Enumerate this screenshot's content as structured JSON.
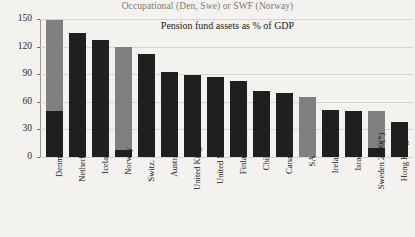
{
  "chart_data": {
    "type": "bar",
    "title": "Pension fund assets as % of GDP",
    "subtitle": "Occupational (Den, Swe) or SWF (Norway)",
    "xlabel": "",
    "ylabel": "",
    "ylim": [
      0,
      150
    ],
    "yticks": [
      0,
      30,
      60,
      90,
      120,
      150
    ],
    "ytick_labels": [
      "0",
      "30",
      "60",
      "90",
      "120",
      "150"
    ],
    "grid": true,
    "legend": "none",
    "stacked": true,
    "colors": {
      "dark": "#1f1f1f",
      "gray": "#808080",
      "background": "#f4f2ee",
      "gridline": "#d7d4ce",
      "axis": "#8d8982"
    },
    "categories": [
      "Denmark",
      "Netherlands",
      "Iceland",
      "Norway",
      "Switz. 2009",
      "Australia",
      "United Kingdom",
      "United States",
      "Finland",
      "Chile",
      "Canada",
      "SA",
      "Ireland",
      "Israel",
      "Sweden 2009(*)",
      "Hong Kong"
    ],
    "series": [
      {
        "name": "Pension fund assets (dark)",
        "color": "#1f1f1f",
        "values": [
          50,
          135,
          127,
          8,
          112,
          92,
          89,
          87,
          83,
          72,
          70,
          0,
          51,
          50,
          10,
          38
        ]
      },
      {
        "name": "Occupational / SWF (gray)",
        "color": "#808080",
        "values": [
          99,
          0,
          0,
          112,
          0,
          0,
          0,
          0,
          0,
          0,
          0,
          65,
          0,
          0,
          40,
          0
        ]
      }
    ],
    "totals": [
      149,
      135,
      127,
      120,
      112,
      92,
      89,
      87,
      83,
      72,
      70,
      65,
      51,
      50,
      50,
      38
    ]
  }
}
